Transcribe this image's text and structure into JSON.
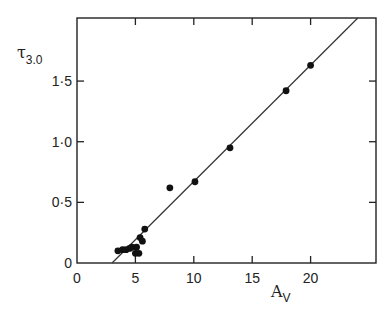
{
  "chart_data": {
    "type": "scatter",
    "title": "",
    "xlabel": "A",
    "xlabel_subscript": "V",
    "ylabel": "τ",
    "ylabel_subscript": "3.0",
    "xlim": [
      0,
      25.6
    ],
    "ylim": [
      0,
      2.02
    ],
    "x_ticks": [
      0,
      5,
      10,
      15,
      20
    ],
    "x_tick_labels": [
      "0",
      "5",
      "10",
      "15",
      "20"
    ],
    "y_ticks": [
      0,
      0.5,
      1.0,
      1.5
    ],
    "y_tick_labels": [
      "0",
      "0·5",
      "1·0",
      "1·5"
    ],
    "grid": false,
    "legend": "none",
    "series": [
      {
        "name": "observations",
        "marker": "filled-circle",
        "points": [
          {
            "x": 3.5,
            "y": 0.1
          },
          {
            "x": 3.9,
            "y": 0.11
          },
          {
            "x": 4.2,
            "y": 0.11
          },
          {
            "x": 4.5,
            "y": 0.12
          },
          {
            "x": 4.7,
            "y": 0.13
          },
          {
            "x": 5.0,
            "y": 0.08
          },
          {
            "x": 5.1,
            "y": 0.13
          },
          {
            "x": 5.3,
            "y": 0.08
          },
          {
            "x": 5.4,
            "y": 0.21
          },
          {
            "x": 5.6,
            "y": 0.18
          },
          {
            "x": 5.8,
            "y": 0.28
          },
          {
            "x": 7.95,
            "y": 0.62
          },
          {
            "x": 10.1,
            "y": 0.67
          },
          {
            "x": 13.1,
            "y": 0.95
          },
          {
            "x": 17.9,
            "y": 1.42
          },
          {
            "x": 20.0,
            "y": 1.63
          }
        ]
      }
    ],
    "fit_line": {
      "name": "linear-fit",
      "x_intercept": 3.0,
      "slope": 0.096
    }
  }
}
